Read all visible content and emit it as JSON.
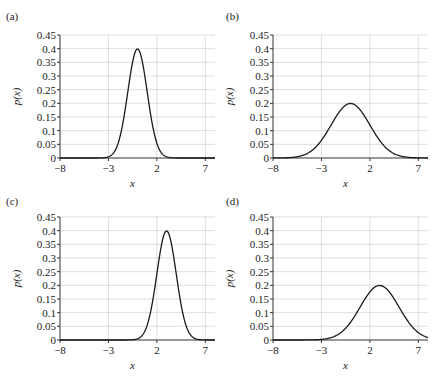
{
  "chart_data": [
    {
      "type": "line",
      "panel": "(a)",
      "title": "",
      "xlabel": "x",
      "ylabel": "p(x)",
      "xlim": [
        -8,
        8
      ],
      "ylim": [
        0,
        0.45
      ],
      "xticks": [
        -8,
        -3,
        2,
        7
      ],
      "yticks": [
        "0",
        "0.05",
        "0.1",
        "0.15",
        "0.2",
        "0.25",
        "0.3",
        "0.35",
        "0.4",
        "0.45"
      ],
      "grid": true,
      "series": [
        {
          "name": "Normal(mean=0, sd=1)",
          "mean": 0,
          "sd": 1,
          "x": [
            -8,
            -4,
            -3,
            -2,
            -1,
            0,
            1,
            2,
            3,
            4,
            8
          ],
          "y": [
            0,
            0.0001,
            0.004,
            0.054,
            0.242,
            0.399,
            0.242,
            0.054,
            0.004,
            0.0001,
            0
          ]
        }
      ]
    },
    {
      "type": "line",
      "panel": "(b)",
      "title": "",
      "xlabel": "x",
      "ylabel": "p(x)",
      "xlim": [
        -8,
        8
      ],
      "ylim": [
        0,
        0.45
      ],
      "xticks": [
        -8,
        -3,
        2,
        7
      ],
      "yticks": [
        "0",
        "0.05",
        "0.1",
        "0.15",
        "0.2",
        "0.25",
        "0.3",
        "0.35",
        "0.4",
        "0.45"
      ],
      "grid": true,
      "series": [
        {
          "name": "Normal(mean=0, sd=2)",
          "mean": 0,
          "sd": 2,
          "x": [
            -8,
            -6,
            -4,
            -2,
            0,
            2,
            4,
            6,
            8
          ],
          "y": [
            0.0001,
            0.002,
            0.027,
            0.121,
            0.199,
            0.121,
            0.027,
            0.002,
            0.0001
          ]
        }
      ]
    },
    {
      "type": "line",
      "panel": "(c)",
      "title": "",
      "xlabel": "x",
      "ylabel": "p(x)",
      "xlim": [
        -8,
        8
      ],
      "ylim": [
        0,
        0.45
      ],
      "xticks": [
        -8,
        -3,
        2,
        7
      ],
      "yticks": [
        "0",
        "0.05",
        "0.1",
        "0.15",
        "0.2",
        "0.25",
        "0.3",
        "0.35",
        "0.4",
        "0.45"
      ],
      "grid": true,
      "series": [
        {
          "name": "Normal(mean=3, sd=1)",
          "mean": 3,
          "sd": 1,
          "x": [
            -8,
            -1,
            0,
            1,
            2,
            3,
            4,
            5,
            6,
            7,
            8
          ],
          "y": [
            0,
            0.0001,
            0.004,
            0.054,
            0.242,
            0.399,
            0.242,
            0.054,
            0.004,
            0.0001,
            0
          ]
        }
      ]
    },
    {
      "type": "line",
      "panel": "(d)",
      "title": "",
      "xlabel": "x",
      "ylabel": "p(x)",
      "xlim": [
        -8,
        8
      ],
      "ylim": [
        0,
        0.45
      ],
      "xticks": [
        -8,
        -3,
        2,
        7
      ],
      "yticks": [
        "0",
        "0.05",
        "0.1",
        "0.15",
        "0.2",
        "0.25",
        "0.3",
        "0.35",
        "0.4",
        "0.45"
      ],
      "grid": true,
      "series": [
        {
          "name": "Normal(mean=3, sd=2)",
          "mean": 3,
          "sd": 2,
          "x": [
            -8,
            -3,
            -1,
            1,
            3,
            5,
            7,
            8
          ],
          "y": [
            0,
            0.002,
            0.027,
            0.121,
            0.199,
            0.121,
            0.027,
            0.009
          ]
        }
      ]
    }
  ],
  "panels": [
    {
      "label": "(a)"
    },
    {
      "label": "(b)"
    },
    {
      "label": "(c)"
    },
    {
      "label": "(d)"
    }
  ]
}
